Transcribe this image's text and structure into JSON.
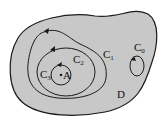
{
  "diagram": {
    "region_label": "D",
    "point_label": "A",
    "curves": [
      {
        "name": "C",
        "sub": "0"
      },
      {
        "name": "C",
        "sub": "1"
      },
      {
        "name": "C",
        "sub": "2"
      },
      {
        "name": "C",
        "sub": "3"
      }
    ],
    "colors": {
      "region_fill": "#c8c8c8",
      "stroke": "#1a1a1a",
      "background": "#ffffff"
    }
  }
}
